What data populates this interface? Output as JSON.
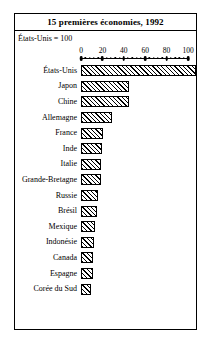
{
  "figure": {
    "title": "15 premières économies, 1992",
    "subtitle": "États-Unis = 100"
  },
  "chart_data": {
    "type": "bar",
    "orientation": "horizontal",
    "title": "15 premières économies, 1992",
    "subtitle": "États-Unis = 100",
    "xlabel": "",
    "ylabel": "",
    "xlim": [
      0,
      100
    ],
    "xticks": [
      0,
      20,
      40,
      60,
      80,
      100
    ],
    "xtick_labels": [
      "0",
      "20",
      "40",
      "60",
      "80",
      "100"
    ],
    "minor_ticks_between_majors": 4,
    "grid": false,
    "legend": null,
    "bar_style": {
      "fill": "diagonal-hatch",
      "hatch_color": "#000000",
      "background": "#ffffff",
      "edge_color": "#000000"
    },
    "categories": [
      "États-Unis",
      "Japon",
      "Chine",
      "Allemagne",
      "France",
      "Inde",
      "Italie",
      "Grande-Bretagne",
      "Russie",
      "Brésil",
      "Mexique",
      "Indonésie",
      "Canada",
      "Espagne",
      "Corée du Sud"
    ],
    "values": [
      100,
      42,
      42,
      27,
      19,
      18,
      17,
      17,
      15,
      14,
      12,
      11,
      10,
      10,
      9
    ]
  }
}
